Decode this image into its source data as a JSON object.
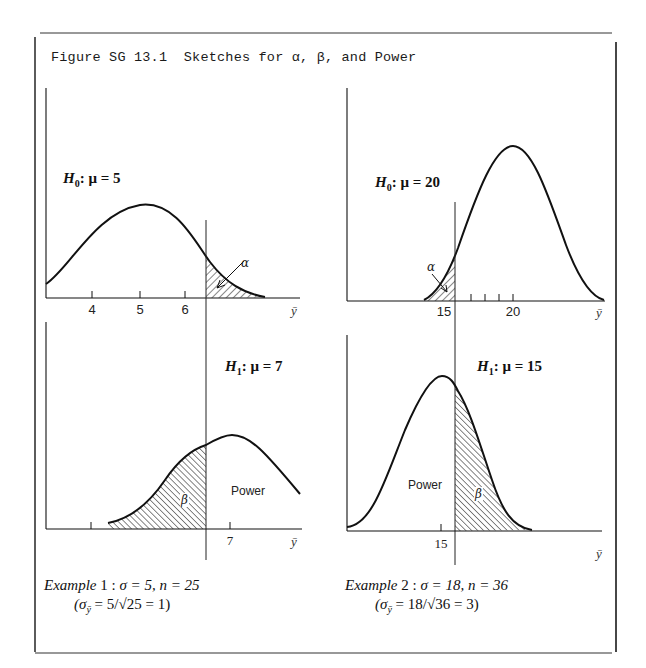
{
  "figure": {
    "caption": "Figure SG 13.1  Sketches for α, β, and Power"
  },
  "panels": {
    "top_left": {
      "hypothesis_label": "H",
      "hypothesis_sub": "0",
      "hypothesis_rest": ": μ = 5",
      "ticks": [
        "4",
        "5",
        "6"
      ],
      "axis_var": "ȳ",
      "region_label": "α"
    },
    "top_right": {
      "hypothesis_label": "H",
      "hypothesis_sub": "0",
      "hypothesis_rest": ": μ = 20",
      "ticks": [
        "15",
        "20"
      ],
      "axis_var": "ȳ",
      "region_label": "α"
    },
    "bottom_left": {
      "hypothesis_label": "H",
      "hypothesis_sub": "1",
      "hypothesis_rest": ": μ = 7",
      "ticks": [
        "7"
      ],
      "axis_var": "ȳ",
      "beta_label": "β",
      "power_label": "Power"
    },
    "bottom_right": {
      "hypothesis_label": "H",
      "hypothesis_sub": "1",
      "hypothesis_rest": ": μ = 15",
      "ticks": [
        "15"
      ],
      "axis_var": "ȳ",
      "beta_label": "β",
      "power_label": "Power"
    }
  },
  "examples": [
    {
      "name": "Example",
      "number": " 1 : ",
      "params": "σ = 5, n = 25",
      "derivation": "(σ",
      "derivation_sub": "ȳ",
      "derivation_rest": " = 5/√25 = 1)"
    },
    {
      "name": "Example",
      "number": " 2 : ",
      "params": "σ = 18, n = 36",
      "derivation": "(σ",
      "derivation_sub": "ȳ",
      "derivation_rest": " = 18/√36 = 3)"
    }
  ],
  "colors": {
    "ink": "#111111",
    "frame": "#222222",
    "background": "#ffffff"
  }
}
